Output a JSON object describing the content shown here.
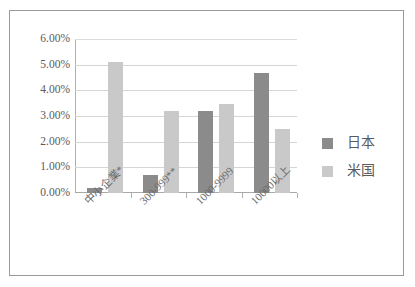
{
  "chart_data": {
    "type": "bar",
    "title": "",
    "xlabel": "",
    "ylabel": "",
    "categories": [
      "中小企業*",
      "300-999**",
      "1000-9999",
      "10000以上"
    ],
    "series": [
      {
        "name": "日本",
        "color": "#8b8b8b",
        "values": [
          0.2,
          0.72,
          3.2,
          4.67
        ]
      },
      {
        "name": "米国",
        "color": "#c9c9c9",
        "values": [
          5.1,
          3.2,
          3.45,
          2.5
        ]
      }
    ],
    "ylim": [
      0,
      6
    ],
    "ytick_values": [
      0,
      1,
      2,
      3,
      4,
      5,
      6
    ],
    "ytick_labels": [
      "0.00%",
      "1.00%",
      "2.00%",
      "3.00%",
      "4.00%",
      "5.00%",
      "6.00%"
    ],
    "grid": true,
    "legend_position": "right",
    "category_label_rotation": -45
  }
}
